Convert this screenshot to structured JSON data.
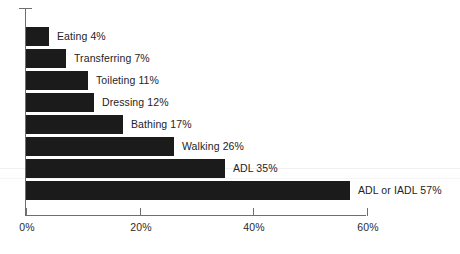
{
  "chart_data": {
    "type": "bar",
    "orientation": "horizontal",
    "title": "",
    "subtitle": "",
    "xlabel": "",
    "ylabel": "",
    "xlim": [
      0,
      60
    ],
    "grid": false,
    "legend": null,
    "bar_color": "#1b1b1b",
    "axis_color": "#6e6e6e",
    "background": "#ffffff",
    "tick_labels": [
      "0%",
      "20%",
      "40%",
      "60%"
    ],
    "tick_values": [
      0,
      20,
      40,
      60
    ],
    "categories": [
      "Eating",
      "Transferring",
      "Toileting",
      "Dressing",
      "Bathing",
      "Walking",
      "ADL",
      "ADL or IADL"
    ],
    "values": [
      4,
      7,
      11,
      12,
      17,
      26,
      35,
      57
    ],
    "data_labels": [
      "Eating 4%",
      "Transferring 7%",
      "Toileting 11%",
      "Dressing 12%",
      "Bathing 17%",
      "Walking 26%",
      "ADL 35%",
      "ADL or IADL 57%"
    ]
  }
}
